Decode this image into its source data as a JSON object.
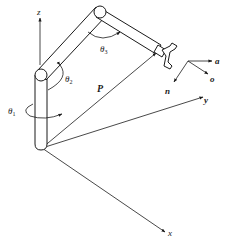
{
  "diagram": {
    "axes": {
      "z": "z",
      "y": "y",
      "x": "x"
    },
    "joint_angles": {
      "theta1": {
        "symbol": "θ",
        "sub": "1"
      },
      "theta2": {
        "symbol": "θ",
        "sub": "2"
      },
      "theta3": {
        "symbol": "θ",
        "sub": "3"
      }
    },
    "position_vector": "P",
    "end_effector_frame": {
      "a": "a",
      "o": "o",
      "n": "n"
    },
    "colors": {
      "line": "#1a1a1a",
      "background": "#ffffff"
    }
  }
}
